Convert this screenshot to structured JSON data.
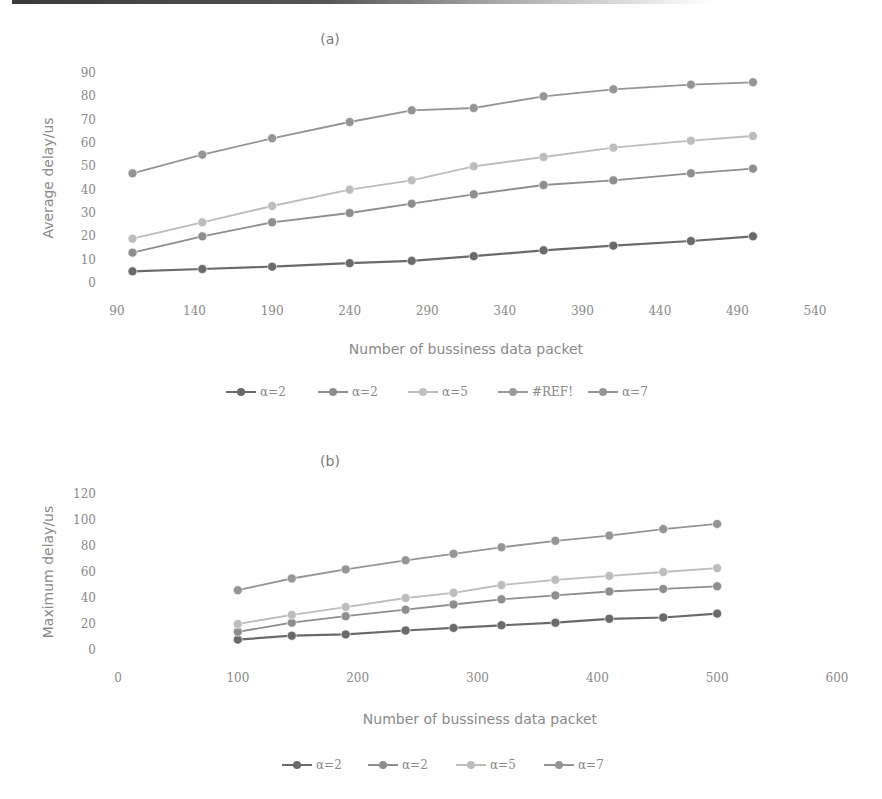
{
  "chart_data": [
    {
      "type": "line",
      "title": "(a)",
      "xlabel": "Number of bussiness data packet",
      "ylabel": "Average delay/us",
      "xlim": [
        90,
        540
      ],
      "ylim": [
        0,
        90
      ],
      "x_ticks": [
        90,
        140,
        190,
        240,
        290,
        340,
        390,
        440,
        490,
        540
      ],
      "y_ticks": [
        0,
        10,
        20,
        30,
        40,
        50,
        60,
        70,
        80,
        90
      ],
      "grid": false,
      "legend_position": "bottom",
      "x": [
        100,
        145,
        190,
        240,
        280,
        320,
        365,
        410,
        460,
        500
      ],
      "series": [
        {
          "name": "α=2",
          "color": "#6a6a6a",
          "values": [
            5,
            6,
            7,
            8.5,
            9.5,
            11.5,
            14,
            16,
            18,
            20
          ]
        },
        {
          "name": "α=2",
          "color": "#8e8e8e",
          "values": [
            13,
            20,
            26,
            30,
            34,
            38,
            42,
            44,
            47,
            49
          ]
        },
        {
          "name": "α=5",
          "color": "#bdbdbd",
          "values": [
            19,
            26,
            33,
            40,
            44,
            50,
            54,
            58,
            61,
            63
          ]
        },
        {
          "name": "#REF!",
          "color": "#9a9a9a",
          "values": []
        },
        {
          "name": "α=7",
          "color": "#959595",
          "values": [
            47,
            55,
            62,
            69,
            74,
            75,
            80,
            83,
            85,
            86
          ]
        }
      ]
    },
    {
      "type": "line",
      "title": "(b)",
      "xlabel": "Number of bussiness data packet",
      "ylabel": "Maximum delay/us",
      "xlim": [
        0,
        600
      ],
      "ylim": [
        0,
        120
      ],
      "x_ticks": [
        0,
        100,
        200,
        300,
        400,
        500,
        600
      ],
      "y_ticks": [
        0,
        20,
        40,
        60,
        80,
        100,
        120
      ],
      "grid": false,
      "legend_position": "bottom",
      "x": [
        100,
        145,
        190,
        240,
        280,
        320,
        365,
        410,
        455,
        500
      ],
      "series": [
        {
          "name": "α=2",
          "color": "#6a6a6a",
          "values": [
            8,
            11,
            12,
            15,
            17,
            19,
            21,
            24,
            25,
            28
          ]
        },
        {
          "name": "α=2",
          "color": "#8e8e8e",
          "values": [
            14,
            21,
            26,
            31,
            35,
            39,
            42,
            45,
            47,
            49
          ]
        },
        {
          "name": "α=5",
          "color": "#bdbdbd",
          "values": [
            20,
            27,
            33,
            40,
            44,
            50,
            54,
            57,
            60,
            63
          ]
        },
        {
          "name": "α=7",
          "color": "#959595",
          "values": [
            46,
            55,
            62,
            69,
            74,
            79,
            84,
            88,
            93,
            97
          ]
        }
      ]
    }
  ],
  "layout": {
    "panels": [
      {
        "plot": {
          "x0": 117,
          "x1": 815,
          "y0": 283,
          "y1": 73
        },
        "title_xy": [
          330,
          44
        ],
        "xtick_y": 315,
        "ytick_x": 96,
        "ylabel_xy": [
          53,
          178
        ],
        "xlabel_xy": [
          466,
          354
        ],
        "legend_y": 392,
        "legend_x0": 226,
        "legend_spacing": [
          0,
          92,
          182,
          272,
          362
        ]
      },
      {
        "plot": {
          "x0": 118,
          "x1": 837,
          "y0": 650,
          "y1": 494
        },
        "title_xy": [
          330,
          466
        ],
        "xtick_y": 682,
        "ytick_x": 96,
        "ylabel_xy": [
          53,
          572
        ],
        "xlabel_xy": [
          480,
          724
        ],
        "legend_y": 765,
        "legend_x0": 282,
        "legend_spacing": [
          0,
          86,
          174,
          262
        ]
      }
    ]
  }
}
